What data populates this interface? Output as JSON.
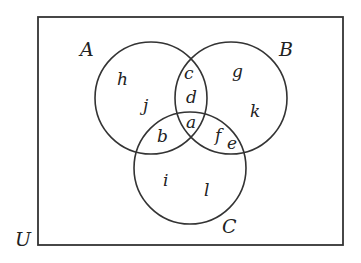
{
  "diagram": {
    "type": "venn",
    "universe": {
      "label": "U",
      "rect": {
        "x": 38,
        "y": 17,
        "width": 305,
        "height": 228
      },
      "label_pos": {
        "x": 15,
        "y": 246
      }
    },
    "colors": {
      "stroke": "#333333",
      "text": "#222222",
      "background": "#ffffff"
    },
    "sets": [
      {
        "label": "A",
        "cx": 151,
        "cy": 98,
        "r": 56,
        "label_pos": {
          "x": 80,
          "y": 56
        }
      },
      {
        "label": "B",
        "cx": 231,
        "cy": 98,
        "r": 56,
        "label_pos": {
          "x": 279,
          "y": 56
        }
      },
      {
        "label": "C",
        "cx": 190,
        "cy": 168,
        "r": 56,
        "label_pos": {
          "x": 222,
          "y": 233
        }
      }
    ],
    "regions": [
      {
        "label": "h",
        "membership": "A only",
        "x": 117,
        "y": 85
      },
      {
        "label": "j",
        "membership": "A only",
        "x": 143,
        "y": 111
      },
      {
        "label": "c",
        "membership": "A and B only",
        "x": 184,
        "y": 79
      },
      {
        "label": "d",
        "membership": "A and B only",
        "x": 186,
        "y": 103
      },
      {
        "label": "g",
        "membership": "B only",
        "x": 232,
        "y": 77
      },
      {
        "label": "k",
        "membership": "B only",
        "x": 250,
        "y": 117
      },
      {
        "label": "a",
        "membership": "A and B and C",
        "x": 186,
        "y": 128
      },
      {
        "label": "b",
        "membership": "A and C only",
        "x": 157,
        "y": 142
      },
      {
        "label": "f",
        "membership": "B and C only",
        "x": 215,
        "y": 141
      },
      {
        "label": "e",
        "membership": "B and C only",
        "x": 227,
        "y": 149
      },
      {
        "label": "i",
        "membership": "C only",
        "x": 163,
        "y": 186
      },
      {
        "label": "l",
        "membership": "C only",
        "x": 204,
        "y": 196
      }
    ]
  }
}
